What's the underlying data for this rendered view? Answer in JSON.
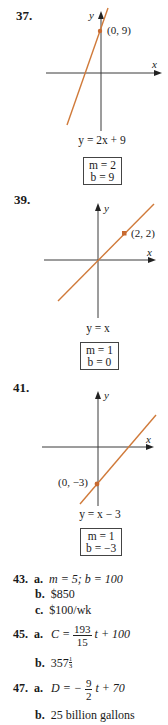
{
  "problems": [
    {
      "number": "37.",
      "equation": "y = 2x + 9",
      "point_label": "(0, 9)",
      "x_axis_label": "x",
      "y_axis_label": "y",
      "box": {
        "m": "m = 2",
        "b": "b = 9"
      }
    },
    {
      "number": "39.",
      "equation": "y = x",
      "point_label": "(2, 2)",
      "x_axis_label": "x",
      "y_axis_label": "y",
      "box": {
        "m": "m = 1",
        "b": "b = 0"
      }
    },
    {
      "number": "41.",
      "equation": "y = x − 3",
      "point_label": "(0, −3)",
      "x_axis_label": "x",
      "y_axis_label": "y",
      "box": {
        "m": "m = 1",
        "b": "b = −3"
      }
    }
  ],
  "answers": {
    "p43": {
      "number": "43.",
      "a_label": "a.",
      "a_text": "m = 5; b = 100",
      "b_label": "b.",
      "b_text": "$850",
      "c_label": "c.",
      "c_text": "$100/wk"
    },
    "p45": {
      "number": "45.",
      "a_label": "a.",
      "a_lhs": "C =",
      "a_num": "193",
      "a_den": "15",
      "a_rhs": "t + 100",
      "b_label": "b.",
      "b_whole": "357",
      "b_num": "1",
      "b_den": "3"
    },
    "p47": {
      "number": "47.",
      "a_label": "a.",
      "a_lhs": "D = −",
      "a_num": "9",
      "a_den": "2",
      "a_rhs": "t + 70",
      "b_label": "b.",
      "b_text": "25 billion gallons"
    }
  },
  "colors": {
    "line": "#d07a3a",
    "point": "#c86a30",
    "axis": "#3a3a3a"
  }
}
